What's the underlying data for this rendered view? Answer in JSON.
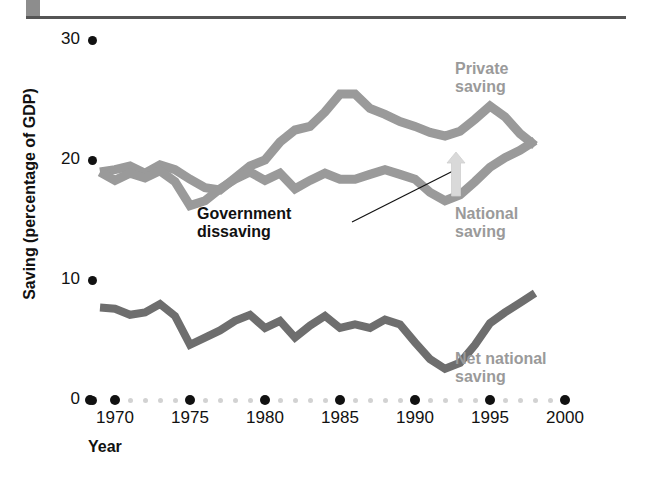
{
  "chart_data": {
    "type": "line",
    "title": "",
    "xlabel": "Year",
    "ylabel": "Saving (percentage of GDP)",
    "xlim": [
      1968,
      2000
    ],
    "ylim": [
      0,
      30
    ],
    "ytick_labels": [
      "0",
      "10",
      "20",
      "30"
    ],
    "yticks": [
      0,
      10,
      20,
      30
    ],
    "xtick_labels": [
      "1970",
      "1975",
      "1980",
      "1985",
      "1990",
      "1995",
      "2000"
    ],
    "xticks": [
      1970,
      1975,
      1980,
      1985,
      1990,
      1995,
      2000
    ],
    "grid": false,
    "legend_position": "inline-annotations",
    "colors": {
      "private_saving": "#9a9a9a",
      "national_saving": "#9a9a9a",
      "net_national_saving": "#6e6e6e",
      "tick": "#111111",
      "minor_tick": "#d2d2d2",
      "annotation": "#111111"
    },
    "annotations": [
      {
        "name": "private-saving-label",
        "text": "Private\nsaving",
        "x": 1993,
        "y": 27.5
      },
      {
        "name": "national-saving-label",
        "text": "National\nsaving",
        "x": 1993,
        "y": 15.5
      },
      {
        "name": "net-national-saving-label",
        "text": "Net national\nsaving",
        "x": 1993,
        "y": 3.5
      },
      {
        "name": "government-dissaving-label",
        "text": "Government\ndissaving",
        "x": 1977,
        "y": 15.5
      }
    ],
    "series": [
      {
        "name": "Private saving",
        "color": "#9a9a9a",
        "x": [
          1969,
          1970,
          1971,
          1972,
          1973,
          1974,
          1975,
          1976,
          1977,
          1978,
          1979,
          1980,
          1981,
          1982,
          1983,
          1984,
          1985,
          1986,
          1987,
          1988,
          1989,
          1990,
          1991,
          1992,
          1993,
          1994,
          1995,
          1996,
          1997,
          1998
        ],
        "values": [
          19.0,
          19.2,
          19.5,
          18.9,
          19.6,
          19.2,
          18.4,
          17.7,
          17.5,
          18.5,
          19.5,
          20.0,
          21.5,
          22.5,
          22.8,
          24.0,
          25.5,
          25.5,
          24.3,
          23.8,
          23.2,
          22.8,
          22.3,
          22.0,
          22.4,
          23.4,
          24.5,
          23.6,
          22.2,
          21.2
        ]
      },
      {
        "name": "National saving",
        "color": "#9a9a9a",
        "x": [
          1969,
          1970,
          1971,
          1972,
          1973,
          1974,
          1975,
          1976,
          1977,
          1978,
          1979,
          1980,
          1981,
          1982,
          1983,
          1984,
          1985,
          1986,
          1987,
          1988,
          1989,
          1990,
          1991,
          1992,
          1993,
          1994,
          1995,
          1996,
          1997,
          1998
        ],
        "values": [
          19.0,
          18.3,
          18.9,
          18.5,
          19.1,
          18.2,
          16.2,
          16.6,
          17.6,
          18.4,
          19.0,
          18.3,
          18.9,
          17.6,
          18.3,
          18.9,
          18.4,
          18.4,
          18.8,
          19.2,
          18.8,
          18.4,
          17.3,
          16.6,
          17.1,
          18.2,
          19.4,
          20.2,
          20.8,
          21.6
        ]
      },
      {
        "name": "Net national saving",
        "color": "#6e6e6e",
        "x": [
          1969,
          1970,
          1971,
          1972,
          1973,
          1974,
          1975,
          1976,
          1977,
          1978,
          1979,
          1980,
          1981,
          1982,
          1983,
          1984,
          1985,
          1986,
          1987,
          1988,
          1989,
          1990,
          1991,
          1992,
          1993,
          1994,
          1995,
          1996,
          1997,
          1998
        ],
        "values": [
          7.7,
          7.6,
          7.1,
          7.3,
          8.0,
          7.0,
          4.6,
          5.2,
          5.8,
          6.6,
          7.1,
          6.0,
          6.6,
          5.2,
          6.2,
          7.0,
          6.0,
          6.3,
          6.0,
          6.7,
          6.3,
          4.8,
          3.4,
          2.6,
          3.1,
          4.6,
          6.4,
          7.3,
          8.1,
          8.9
        ]
      }
    ],
    "x_minor_tick_years": [
      1971,
      1972,
      1973,
      1974,
      1976,
      1977,
      1978,
      1979,
      1981,
      1982,
      1983,
      1984,
      1986,
      1987,
      1988,
      1989,
      1991,
      1992,
      1993,
      1994,
      1996,
      1997,
      1998,
      1999
    ]
  },
  "axis": {
    "y_label": "Saving (percentage of GDP)",
    "x_label": "Year"
  },
  "labels": {
    "private_saving": "Private\nsaving",
    "national_saving": "National\nsaving",
    "net_national_saving": "Net national\nsaving",
    "government_dissaving": "Government\ndissaving"
  },
  "ticks": {
    "y": [
      "30",
      "20",
      "10",
      "0"
    ],
    "x": [
      "1970",
      "1975",
      "1980",
      "1985",
      "1990",
      "1995",
      "2000"
    ]
  }
}
